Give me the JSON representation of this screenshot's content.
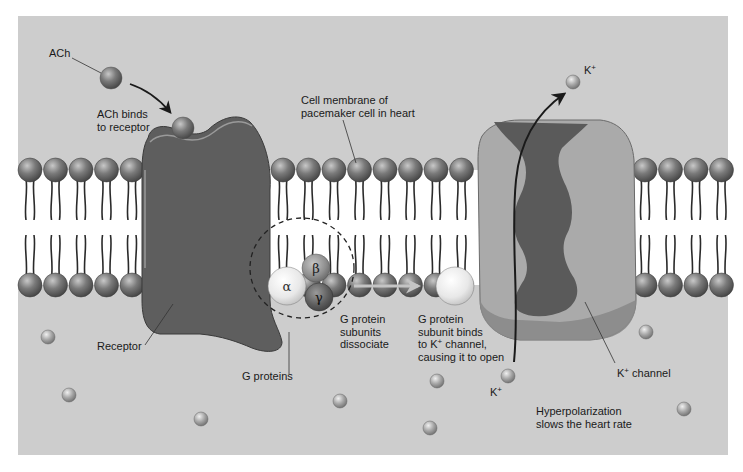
{
  "frame": {
    "x": 18,
    "y": 16,
    "width": 710,
    "height": 439
  },
  "colors": {
    "background_outer": "#ffffff",
    "extracellular": "#cdcdcd",
    "membrane_core": "#ffffff",
    "phospholipid_head": "#6e6e6e",
    "lipid_tail": "#2a2a2a",
    "receptor": "#5e5e5e",
    "receptor_highlight": "#9a9a9a",
    "channel_outer": "#aaaaaa",
    "channel_inner": "#5a5a5a",
    "channel_mid": "#8a8a8a",
    "ion": "#9a9a9a",
    "alpha_subunit": "#ececec",
    "beta_subunit": "#8c8c8c",
    "gamma_subunit": "#5c5c5c",
    "arrow": "#1a1a1a",
    "dissociation_arrow": "#c4c4c4",
    "text": "#1a1a1a"
  },
  "membrane": {
    "upper_head_y": 170,
    "lower_head_y": 285,
    "head_radius": 12,
    "spacing": 25.5,
    "segments": [
      {
        "name": "left",
        "x_start": 30,
        "x_end": 138
      },
      {
        "name": "middle",
        "x_start": 283,
        "x_end": 465
      },
      {
        "name": "right",
        "x_start": 645,
        "x_end": 728
      }
    ]
  },
  "labels": {
    "ach": "ACh",
    "ach_binds": "ACh binds\nto receptor",
    "cell_membrane": "Cell membrane of\npacemaker cell in heart",
    "receptor": "Receptor",
    "g_proteins": "G proteins",
    "g_protein_dissociate": "G protein\nsubunits\ndissociate",
    "g_protein_binds_pre": "G protein\nsubunit binds\nto K",
    "g_protein_binds_sup": "+",
    "g_protein_binds_post": " channel,\ncausing it to open",
    "k_top": "K",
    "k_top_sup": "+",
    "k_bottom": "K",
    "k_bottom_sup": "+",
    "k_channel": "K",
    "k_channel_sup": "+",
    "k_channel_post": " channel",
    "hyperpolarization": "Hyperpolarization\nslows the heart rate",
    "alpha": "α",
    "beta": "β",
    "gamma": "γ"
  },
  "ions": [
    {
      "x": 48,
      "y": 337,
      "r": 7
    },
    {
      "x": 69,
      "y": 395,
      "r": 7
    },
    {
      "x": 201,
      "y": 419,
      "r": 7
    },
    {
      "x": 340,
      "y": 401,
      "r": 7
    },
    {
      "x": 437,
      "y": 381,
      "r": 7
    },
    {
      "x": 430,
      "y": 428,
      "r": 7
    },
    {
      "x": 646,
      "y": 332,
      "r": 7
    },
    {
      "x": 684,
      "y": 409,
      "r": 7
    },
    {
      "x": 508,
      "y": 376,
      "r": 7
    },
    {
      "x": 573,
      "y": 82,
      "r": 7
    }
  ],
  "ach_molecule": {
    "x": 111,
    "y": 78,
    "r": 11
  },
  "ach_bound": {
    "x": 183,
    "y": 128,
    "r": 11
  }
}
